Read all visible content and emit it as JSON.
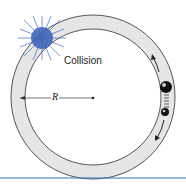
{
  "diagram": {
    "labels": {
      "collision": "Collision",
      "radius": "R"
    },
    "colors": {
      "ring_fill": "#e6e6e6",
      "ring_stroke": "#555555",
      "collision_burst": "#3a5fb5",
      "baseline": "#3a6fc0"
    },
    "elements": [
      "circular-ring-track",
      "collision-burst",
      "radius-line",
      "large-ball",
      "spring",
      "small-ball",
      "arrow-up",
      "arrow-down"
    ]
  }
}
